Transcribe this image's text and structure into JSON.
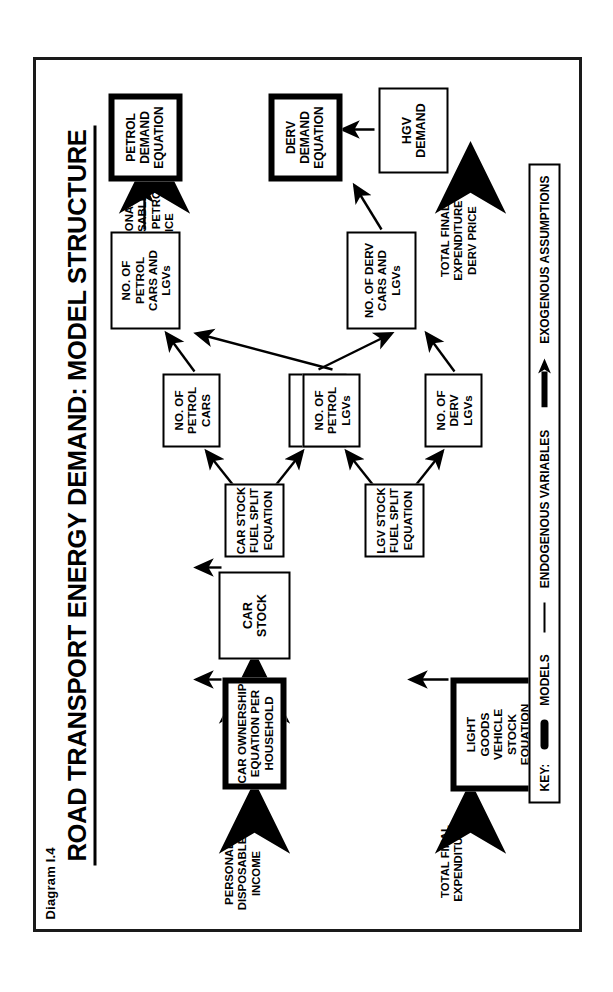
{
  "diagram_number": "Diagram I.4",
  "title": "ROAD TRANSPORT ENERGY DEMAND:  MODEL STRUCTURE",
  "boxes": {
    "car_ownership": "CAR OWNERSHIP\nEQUATION PER\nHOUSEHOLD",
    "car_stock": "CAR\nSTOCK",
    "car_fuel_split": "CAR STOCK\nFUEL SPLIT\nEQUATION",
    "no_petrol_cars": "NO. OF\nPETROL\nCARS",
    "no_derv_cars": "NO. OF\nDERV CARS",
    "no_petrol_cars_lgvs": "NO. OF\nPETROL\nCARS AND\nLGVs",
    "petrol_demand_equation": "PETROL\nDEMAND\nEQUATION",
    "lgv_stock_equation": "LIGHT\nGOODS\nVEHICLE\nSTOCK\nEQUATION",
    "lgv_fuel_split": "LGV STOCK\nFUEL SPLIT\nEQUATION",
    "no_petrol_lgvs": "NO. OF\nPETROL LGVs",
    "no_derv_lgvs": "NO. OF DERV\nLGVs",
    "no_derv_cars_lgvs": "NO. OF DERV\nCARS AND\nLGVs",
    "derv_demand_equation": "DERV\nDEMAND\nEQUATION",
    "hgv_demand": "HGV\nDEMAND"
  },
  "exogenous_labels": {
    "personal_disposable_income": "PERSONAL DISPOSABLE\nINCOME",
    "number_of_uk_households": "NUMBER OF UK\nHOUSEHOLDS",
    "income_petrol_price": "PERSONAL DISPOSABLE\nINCOME PETROL PRICE",
    "total_final_expenditure": "TOTAL FINAL\nEXPENDITURE",
    "tfe_derv_price": "TOTAL FINAL EXPENDITURE\nDERV PRICE"
  },
  "key": {
    "title": "KEY:",
    "entries": [
      {
        "label": "MODELS",
        "glyph": "thick-rounded-bar"
      },
      {
        "label": "ENDOGENOUS VARIABLES",
        "glyph": "thin-line"
      },
      {
        "label": "EXOGENOUS ASSUMPTIONS",
        "glyph": "thick-arrow"
      }
    ]
  },
  "colors": {
    "ink": "#000000",
    "frame": "#1a1a1a",
    "paper": "#ffffff"
  }
}
